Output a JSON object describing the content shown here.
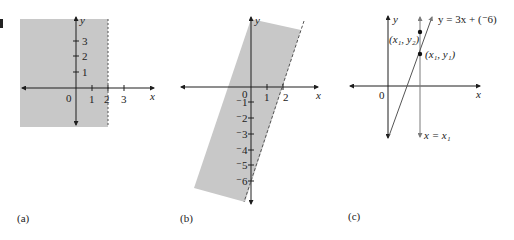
{
  "colors": {
    "shade": "#c8c8c8",
    "axis": "#1e1e1e",
    "dashed": "#555555",
    "vline": "#7a7a7a",
    "text": "#222222"
  },
  "panels": [
    {
      "caption": "(a)",
      "x_label": "x",
      "y_label": "y",
      "origin_label": "0",
      "x_ticks": [
        "1",
        "2",
        "3"
      ],
      "y_ticks": [
        "1",
        "2",
        "3"
      ],
      "boundary": "x = 2 (dashed)",
      "shaded": "x < 2"
    },
    {
      "caption": "(b)",
      "x_label": "x",
      "y_label": "y",
      "origin_label": "0",
      "x_ticks": [
        "1",
        "2"
      ],
      "y_ticks": [
        "⁻1",
        "⁻2",
        "⁻3",
        "⁻4",
        "⁻5",
        "⁻6"
      ],
      "boundary": "y = 3x − 6 (dashed)",
      "shaded": "y > 3x − 6"
    },
    {
      "caption": "(c)",
      "x_label": "x",
      "y_label": "y",
      "origin_label": "0",
      "line_label": "y = 3x + (⁻6)",
      "point1_label": "(x₁, y₁)",
      "point2_label": "(x₁, y₂)",
      "vline_label": "x = x₁"
    }
  ]
}
